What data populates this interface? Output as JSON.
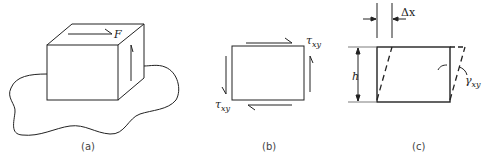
{
  "figure": {
    "panels": [
      {
        "id": "a",
        "caption": "(a)",
        "description": "Block fixed to a surface with shear force F on top face",
        "labels": {
          "force": "F"
        }
      },
      {
        "id": "b",
        "caption": "(b)",
        "description": "Element with shear stresses on all four faces",
        "labels": {
          "tau_top_symbol": "τ",
          "tau_top_sub": "xy",
          "tau_bottom_symbol": "τ",
          "tau_bottom_sub": "xy"
        }
      },
      {
        "id": "c",
        "caption": "(c)",
        "description": "Shear deformation of element",
        "labels": {
          "displacement": "Δx",
          "height": "h",
          "strain_symbol": "γ",
          "strain_sub": "xy"
        }
      }
    ],
    "colors": {
      "stroke": "#222222",
      "background": "#ffffff"
    }
  }
}
